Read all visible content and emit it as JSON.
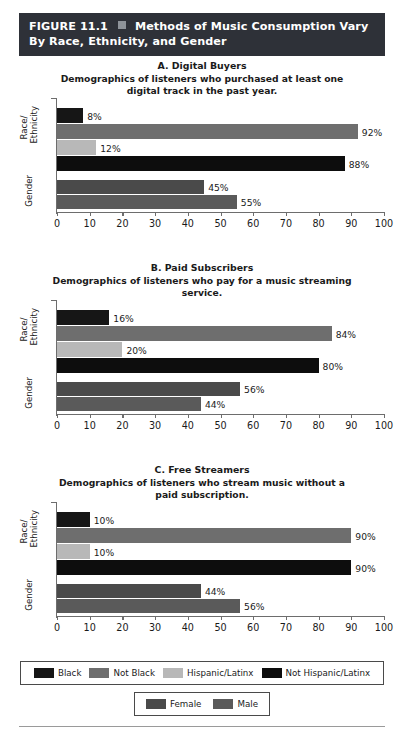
{
  "figure": {
    "number_label": "FIGURE 11.1",
    "separator_icon": "square-bullet-icon",
    "title": "Methods of Music Consumption Vary By Race, Ethnicity, and Gender"
  },
  "colors": {
    "banner_bg": "#2e3138",
    "black": "#161616",
    "not_black": "#6e6e6e",
    "hispanic_latinx": "#b8b8b8",
    "not_hispanic_latinx": "#0d0d0d",
    "female": "#4a4a4a",
    "male": "#5a5a5a",
    "axis": "#6d6d6d"
  },
  "axis": {
    "ticks": [
      0,
      10,
      20,
      30,
      40,
      50,
      60,
      70,
      80,
      90,
      100
    ],
    "min": 0,
    "max": 100,
    "group_labels": {
      "race": "Race/\nEthnicity",
      "race_line1": "Race/",
      "race_line2": "Ethnicity",
      "gender": "Gender"
    }
  },
  "legends": {
    "race_ethnicity": [
      {
        "label": "Black",
        "color_key": "black"
      },
      {
        "label": "Not Black",
        "color_key": "not_black"
      },
      {
        "label": "Hispanic/Latinx",
        "color_key": "hispanic_latinx"
      },
      {
        "label": "Not Hispanic/Latinx",
        "color_key": "not_hispanic_latinx"
      }
    ],
    "gender": [
      {
        "label": "Female",
        "color_key": "female"
      },
      {
        "label": "Male",
        "color_key": "male"
      }
    ]
  },
  "chart_data": [
    {
      "type": "bar",
      "orientation": "horizontal",
      "id": "A",
      "title": "A. Digital Buyers",
      "subtitle": "Demographics of listeners who purchased at least one digital track in the past year.",
      "xlabel": "",
      "ylabel": "",
      "xlim": [
        0,
        100
      ],
      "grid": false,
      "categories": [
        "Black",
        "Not Black",
        "Hispanic/Latinx",
        "Not Hispanic/Latinx",
        "Female",
        "Male"
      ],
      "values": [
        8,
        92,
        12,
        88,
        45,
        55
      ],
      "labels": [
        "8%",
        "92%",
        "12%",
        "88%",
        "45%",
        "55%"
      ]
    },
    {
      "type": "bar",
      "orientation": "horizontal",
      "id": "B",
      "title": "B. Paid Subscribers",
      "subtitle": "Demographics of listeners who pay for a music streaming service.",
      "xlabel": "",
      "ylabel": "",
      "xlim": [
        0,
        100
      ],
      "grid": false,
      "categories": [
        "Black",
        "Not Black",
        "Hispanic/Latinx",
        "Not Hispanic/Latinx",
        "Female",
        "Male"
      ],
      "values": [
        16,
        84,
        20,
        80,
        56,
        44
      ],
      "labels": [
        "16%",
        "84%",
        "20%",
        "80%",
        "56%",
        "44%"
      ]
    },
    {
      "type": "bar",
      "orientation": "horizontal",
      "id": "C",
      "title": "C. Free Streamers",
      "subtitle": "Demographics of listeners who stream music without a paid subscription.",
      "xlabel": "",
      "ylabel": "",
      "xlim": [
        0,
        100
      ],
      "grid": false,
      "categories": [
        "Black",
        "Not Black",
        "Hispanic/Latinx",
        "Not Hispanic/Latinx",
        "Female",
        "Male"
      ],
      "values": [
        10,
        90,
        10,
        90,
        44,
        56
      ],
      "labels": [
        "10%",
        "90%",
        "10%",
        "90%",
        "44%",
        "56%"
      ]
    }
  ]
}
